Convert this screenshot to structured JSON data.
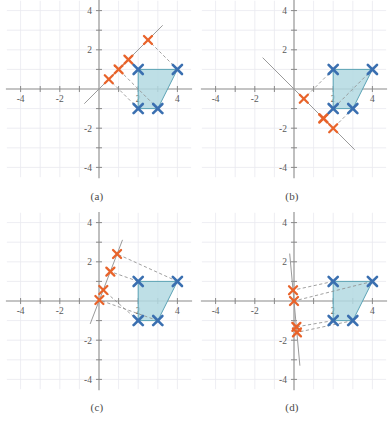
{
  "figure": {
    "title": "",
    "panel_count": 4,
    "width": 389,
    "height": 423,
    "background": "#ffffff",
    "colors": {
      "marker_blue": "#3a6fb0",
      "marker_red": "#e8632a",
      "polygon_fill": "#b3d9e2",
      "polygon_edge": "#5ba3b5",
      "axis": "#8a8a8a",
      "grid": "#e9e9ef",
      "dashed": "#8f8f8f",
      "projection_line": "#9a9a9a",
      "label": "#5a5a5a"
    },
    "axis": {
      "xlim": [
        -4.6,
        4.6
      ],
      "ylim": [
        -4.6,
        4.6
      ],
      "xticks": [
        -4,
        -2,
        2,
        4
      ],
      "yticks": [
        -4,
        -2,
        2,
        4
      ],
      "xtick_labels": [
        "-4",
        "-2",
        "2",
        "4"
      ],
      "ytick_labels": [
        "-4",
        "-2",
        "2",
        "4"
      ],
      "grid": true,
      "grid_step": 1
    }
  },
  "chart_data": {
    "type": "scatter",
    "title": "",
    "xlabel": "",
    "ylabel": "",
    "xlim": [
      -4.6,
      4.6
    ],
    "ylim": [
      -4.6,
      4.6
    ],
    "panels": [
      {
        "id": "a",
        "caption": "(a)",
        "projection_line": {
          "label": "y = x",
          "slope": 1,
          "intercept": 0,
          "x_from": -0.75,
          "x_to": 3.25
        },
        "shape": {
          "name": "quadrilateral",
          "vertices": [
            [
              2,
              1
            ],
            [
              4,
              1
            ],
            [
              3,
              -1
            ],
            [
              2,
              -1
            ]
          ],
          "fill": "#b3d9e2"
        },
        "blue_points": [
          [
            2,
            1
          ],
          [
            4,
            1
          ],
          [
            3,
            -1
          ],
          [
            2,
            -1
          ]
        ],
        "red_points": [
          [
            1,
            1
          ],
          [
            2.5,
            2.5
          ],
          [
            0.5,
            0.5
          ],
          [
            1.5,
            1.5
          ]
        ],
        "projection_pairs": [
          {
            "from": [
              2,
              1
            ],
            "to": [
              1.5,
              1.5
            ]
          },
          {
            "from": [
              4,
              1
            ],
            "to": [
              2.5,
              2.5
            ]
          },
          {
            "from": [
              3,
              -1
            ],
            "to": [
              1,
              1
            ]
          },
          {
            "from": [
              2,
              -1
            ],
            "to": [
              0.5,
              0.5
            ]
          }
        ]
      },
      {
        "id": "b",
        "caption": "(b)",
        "projection_line": {
          "label": "y = -x",
          "slope": -1,
          "intercept": 0,
          "x_from": -1.6,
          "x_to": 3.1
        },
        "shape": {
          "name": "quadrilateral",
          "vertices": [
            [
              2,
              1
            ],
            [
              4,
              1
            ],
            [
              3,
              -1
            ],
            [
              2,
              -1
            ]
          ],
          "fill": "#b3d9e2"
        },
        "blue_points": [
          [
            2,
            1
          ],
          [
            4,
            1
          ],
          [
            3,
            -1
          ],
          [
            2,
            -1
          ]
        ],
        "red_points": [
          [
            0.5,
            -0.5
          ],
          [
            1.5,
            -1.5
          ],
          [
            2,
            -2
          ],
          [
            1.5,
            -1.5
          ]
        ],
        "projection_pairs": [
          {
            "from": [
              2,
              1
            ],
            "to": [
              0.5,
              -0.5
            ]
          },
          {
            "from": [
              4,
              1
            ],
            "to": [
              1.5,
              -1.5
            ]
          },
          {
            "from": [
              3,
              -1
            ],
            "to": [
              2,
              -2
            ]
          },
          {
            "from": [
              2,
              -1
            ],
            "to": [
              1.5,
              -1.5
            ]
          }
        ]
      },
      {
        "id": "c",
        "caption": "(c)",
        "projection_line": {
          "label": "steep line through origin",
          "slope": 2.6,
          "intercept": 0,
          "x_from": -0.45,
          "x_to": 1.2
        },
        "shape": {
          "name": "quadrilateral",
          "vertices": [
            [
              2,
              1
            ],
            [
              4,
              1
            ],
            [
              3,
              -1
            ],
            [
              2,
              -1
            ]
          ],
          "fill": "#b3d9e2"
        },
        "blue_points": [
          [
            2,
            1
          ],
          [
            4,
            1
          ],
          [
            3,
            -1
          ],
          [
            2,
            -1
          ]
        ],
        "red_points": [
          [
            0.22,
            0.56
          ],
          [
            0.58,
            1.5
          ],
          [
            0.92,
            2.4
          ],
          [
            0.02,
            0.05
          ]
        ],
        "projection_pairs": [
          {
            "from": [
              2,
              1
            ],
            "to": [
              0.58,
              1.5
            ]
          },
          {
            "from": [
              4,
              1
            ],
            "to": [
              0.92,
              2.4
            ]
          },
          {
            "from": [
              3,
              -1
            ],
            "to": [
              0.02,
              0.05
            ]
          },
          {
            "from": [
              2,
              -1
            ],
            "to": [
              0.22,
              0.56
            ]
          }
        ]
      },
      {
        "id": "d",
        "caption": "(d)",
        "projection_line": {
          "label": "near-vertical line through origin",
          "slope": -11,
          "intercept": 0,
          "x_from": -0.22,
          "x_to": 0.3
        },
        "shape": {
          "name": "quadrilateral",
          "vertices": [
            [
              2,
              1
            ],
            [
              4,
              1
            ],
            [
              3,
              -1
            ],
            [
              2,
              -1
            ]
          ],
          "fill": "#b3d9e2"
        },
        "blue_points": [
          [
            2,
            1
          ],
          [
            4,
            1
          ],
          [
            3,
            -1
          ],
          [
            2,
            -1
          ]
        ],
        "red_points": [
          [
            -0.05,
            0.55
          ],
          [
            0.0,
            0.0
          ],
          [
            0.12,
            -1.32
          ],
          [
            0.15,
            -1.6
          ]
        ],
        "projection_pairs": [
          {
            "from": [
              2,
              1
            ],
            "to": [
              -0.05,
              0.55
            ]
          },
          {
            "from": [
              4,
              1
            ],
            "to": [
              0.0,
              0.0
            ]
          },
          {
            "from": [
              3,
              -1
            ],
            "to": [
              0.15,
              -1.6
            ]
          },
          {
            "from": [
              2,
              -1
            ],
            "to": [
              0.12,
              -1.32
            ]
          }
        ]
      }
    ]
  }
}
